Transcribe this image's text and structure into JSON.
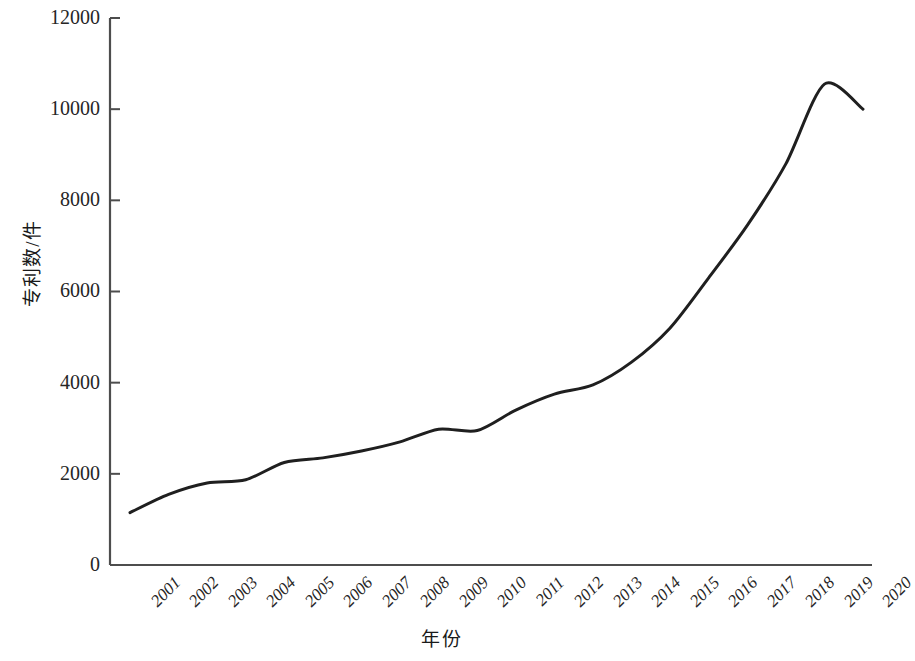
{
  "chart_data": {
    "type": "line",
    "title": "",
    "xlabel": "年份",
    "ylabel": "专利数/件",
    "categories": [
      "2001",
      "2002",
      "2003",
      "2004",
      "2005",
      "2006",
      "2007",
      "2008",
      "2009",
      "2010",
      "2011",
      "2012",
      "2013",
      "2014",
      "2015",
      "2016",
      "2017",
      "2018",
      "2019",
      "2020"
    ],
    "values": [
      1150,
      1550,
      1800,
      1870,
      2250,
      2350,
      2500,
      2700,
      2980,
      2950,
      3400,
      3750,
      3950,
      4450,
      5200,
      6300,
      7450,
      8800,
      10550,
      10000
    ],
    "ytick_labels": [
      "0",
      "2000",
      "4000",
      "6000",
      "8000",
      "10000",
      "12000"
    ],
    "ytick_values": [
      0,
      2000,
      4000,
      6000,
      8000,
      10000,
      12000
    ],
    "ylim": [
      0,
      12000
    ],
    "xlim": [
      "2001",
      "2020"
    ],
    "grid": false,
    "legend": null,
    "line_color": "#1f1f1f",
    "axis_color": "#4d4d4d"
  }
}
